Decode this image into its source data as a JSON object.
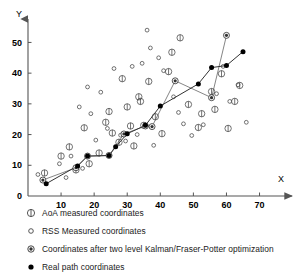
{
  "chart": {
    "type": "scatter",
    "title": "",
    "xlabel": "X",
    "ylabel": "Y",
    "xticks": [
      10,
      20,
      30,
      40,
      50,
      60,
      70
    ],
    "yticks": [
      0,
      10,
      20,
      30,
      40,
      50
    ],
    "xlim": [
      0,
      78
    ],
    "ylim": [
      0,
      56
    ],
    "grid": false,
    "legend_position": "below-plot"
  },
  "legend": {
    "items": [
      {
        "marker": "circle-with-vertical-tick",
        "label": "AoA measured coordinates"
      },
      {
        "marker": "small-open-circle",
        "label": "RSS Measured coordinates"
      },
      {
        "marker": "circle-with-filled-center",
        "label": "Coordinates after two level Kalman/Fraser-Potter optimization"
      },
      {
        "marker": "filled-circle",
        "label": "Real path coordinates"
      }
    ]
  },
  "colors": {
    "axis": "#555555",
    "marker_outline": "#444444",
    "filled_marker": "#000000",
    "path_line": "#333333",
    "optimized_line": "#666666",
    "text": "#1a1a1a"
  },
  "chart_data": {
    "type": "scatter",
    "title": "",
    "xlabel": "X",
    "ylabel": "Y",
    "xlim": [
      0,
      78
    ],
    "ylim": [
      0,
      56
    ],
    "xticks": [
      10,
      20,
      30,
      40,
      50,
      60,
      70
    ],
    "yticks": [
      0,
      10,
      20,
      30,
      40,
      50
    ],
    "grid": false,
    "legend_position": "below-plot",
    "series": [
      {
        "name": "AoA measured coordinates",
        "marker": "circle-with-vertical-tick",
        "points": [
          [
            5.0,
            7.5
          ],
          [
            12.5,
            16.0
          ],
          [
            14.5,
            8.5
          ],
          [
            17.0,
            22.2
          ],
          [
            18.5,
            10.5
          ],
          [
            21.5,
            14.0
          ],
          [
            23.5,
            24.0
          ],
          [
            24.5,
            27.5
          ],
          [
            25.5,
            20.5
          ],
          [
            27.5,
            17.5
          ],
          [
            28.5,
            38.2
          ],
          [
            30.0,
            29.0
          ],
          [
            31.0,
            22.8
          ],
          [
            32.0,
            16.3
          ],
          [
            33.5,
            32.3
          ],
          [
            34.0,
            30.8
          ],
          [
            35.0,
            23.0
          ],
          [
            36.5,
            37.3
          ],
          [
            38.5,
            25.8
          ],
          [
            40.5,
            20.3
          ],
          [
            42.5,
            40.5
          ],
          [
            43.5,
            46.8
          ],
          [
            46.0,
            51.5
          ],
          [
            48.5,
            29.8
          ],
          [
            51.5,
            22.3
          ],
          [
            52.5,
            26.8
          ],
          [
            55.5,
            34.0
          ],
          [
            56.5,
            28.2
          ],
          [
            58.5,
            39.8
          ],
          [
            60.5,
            22.0
          ],
          [
            62.5,
            30.8
          ],
          [
            64.0,
            36.0
          ],
          [
            10.0,
            13.0
          ]
        ]
      },
      {
        "name": "RSS Measured coordinates",
        "marker": "small-open-circle",
        "points": [
          [
            3.0,
            7.0
          ],
          [
            9.5,
            10.5
          ],
          [
            11.5,
            6.0
          ],
          [
            13.0,
            13.0
          ],
          [
            16.5,
            9.0
          ],
          [
            19.0,
            26.8
          ],
          [
            20.5,
            18.2
          ],
          [
            22.0,
            33.8
          ],
          [
            24.0,
            22.0
          ],
          [
            26.0,
            41.5
          ],
          [
            28.0,
            19.8
          ],
          [
            29.5,
            17.9
          ],
          [
            31.5,
            42.2
          ],
          [
            33.0,
            20.0
          ],
          [
            34.5,
            43.2
          ],
          [
            36.0,
            54.0
          ],
          [
            37.0,
            48.2
          ],
          [
            38.0,
            16.5
          ],
          [
            39.5,
            45.0
          ],
          [
            41.0,
            40.8
          ],
          [
            44.0,
            32.3
          ],
          [
            45.5,
            27.2
          ],
          [
            47.0,
            23.5
          ],
          [
            49.5,
            19.7
          ],
          [
            53.0,
            23.2
          ],
          [
            57.0,
            33.3
          ],
          [
            59.0,
            42.2
          ],
          [
            61.0,
            30.8
          ],
          [
            63.5,
            36.2
          ],
          [
            66.0,
            24.0
          ],
          [
            15.5,
            29.0
          ],
          [
            18.0,
            35.5
          ]
        ]
      },
      {
        "name": "Coordinates after two level Kalman/Fraser-Potter optimization",
        "marker": "circle-with-filled-center",
        "points": [
          [
            4.5,
            5.2
          ],
          [
            14.5,
            9.2
          ],
          [
            18.0,
            13.0
          ],
          [
            24.5,
            13.2
          ],
          [
            29.0,
            20.2
          ],
          [
            35.5,
            22.8
          ],
          [
            37.5,
            22.6
          ],
          [
            44.5,
            37.5
          ],
          [
            55.5,
            32.0
          ],
          [
            60.0,
            52.3
          ]
        ],
        "connected": true
      },
      {
        "name": "Real path coordinates",
        "marker": "filled-circle",
        "points": [
          [
            5.5,
            4.0
          ],
          [
            15.0,
            9.8
          ],
          [
            18.0,
            13.0
          ],
          [
            24.5,
            13.2
          ],
          [
            26.5,
            16.0
          ],
          [
            30.0,
            20.3
          ],
          [
            35.5,
            23.0
          ],
          [
            40.0,
            29.3
          ],
          [
            51.5,
            36.5
          ],
          [
            55.5,
            41.8
          ],
          [
            60.0,
            42.5
          ],
          [
            65.0,
            47.0
          ]
        ],
        "connected": true
      }
    ]
  }
}
